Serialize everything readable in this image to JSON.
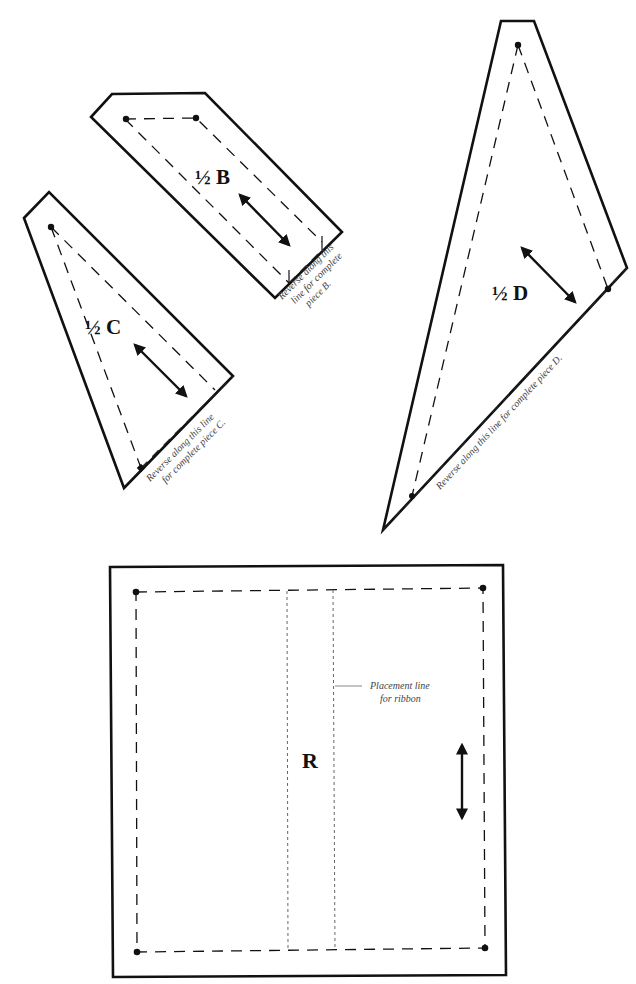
{
  "pieces": {
    "b": {
      "label": "½ B",
      "note_line1": "Reverse along this",
      "note_line2": "line for complete",
      "note_line3": "piece B."
    },
    "c": {
      "label": "½ C",
      "note_line1": "Reverse along this line",
      "note_line2": "for complete piece C."
    },
    "d": {
      "label": "½ D",
      "note_line1": "Reverse along this line for complete piece D."
    },
    "r": {
      "label": "R",
      "note_line1": "Placement line",
      "note_line2": "for ribbon"
    }
  },
  "colors": {
    "line": "#111111",
    "note_text": "#444444",
    "placement_line": "#666666",
    "background": "#ffffff"
  }
}
